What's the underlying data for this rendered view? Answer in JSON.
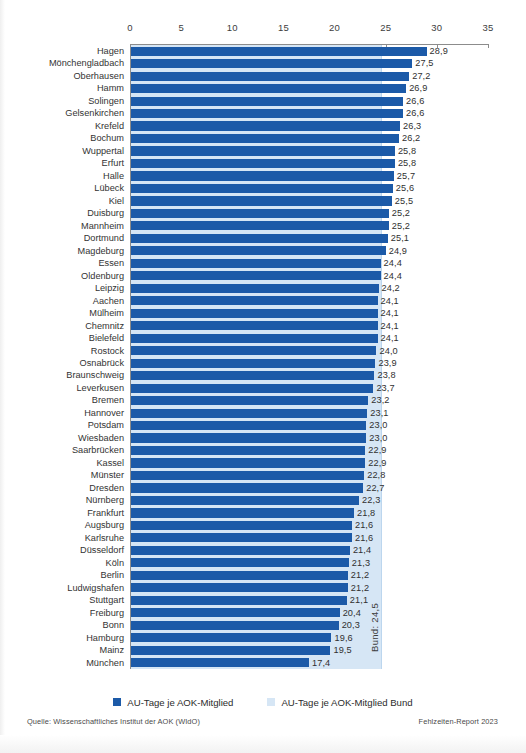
{
  "footer": {
    "source": "Quelle: Wissenschaftliches Institut der AOK (WIdO)",
    "report": "Fehlzeiten-Report 2023"
  },
  "legend": [
    {
      "label": "AU-Tage je AOK-Mitglied",
      "color": "#1c5aa8",
      "key": "primary"
    },
    {
      "label": "AU-Tage je AOK-Mitglied Bund",
      "color": "#d6e6f5",
      "key": "bund"
    }
  ],
  "reference": {
    "label": "Bund: 24,5",
    "value": 24.5
  },
  "chart_data": {
    "type": "bar",
    "orientation": "horizontal",
    "title": "",
    "xlabel": "",
    "ylabel": "",
    "xlim": [
      0,
      35
    ],
    "xticks": [
      0,
      5,
      10,
      15,
      20,
      25,
      30,
      35
    ],
    "xtick_labels": [
      "0",
      "5",
      "10",
      "15",
      "20",
      "25",
      "30",
      "35"
    ],
    "grid": false,
    "legend_position": "bottom-center",
    "decimal_separator": ",",
    "series": [
      {
        "name": "AU-Tage je AOK-Mitglied",
        "color": "#1c5aa8",
        "values": [
          28.9,
          27.5,
          27.2,
          26.9,
          26.6,
          26.6,
          26.3,
          26.2,
          25.8,
          25.8,
          25.7,
          25.6,
          25.5,
          25.2,
          25.2,
          25.1,
          24.9,
          24.4,
          24.4,
          24.2,
          24.1,
          24.1,
          24.1,
          24.1,
          24.0,
          23.9,
          23.8,
          23.7,
          23.2,
          23.1,
          23.0,
          23.0,
          22.9,
          22.9,
          22.8,
          22.7,
          22.3,
          21.8,
          21.6,
          21.6,
          21.4,
          21.3,
          21.2,
          21.2,
          21.1,
          20.4,
          20.3,
          19.6,
          19.5,
          17.4
        ]
      }
    ],
    "categories": [
      "Hagen",
      "Mönchengladbach",
      "Oberhausen",
      "Hamm",
      "Solingen",
      "Gelsenkirchen",
      "Krefeld",
      "Bochum",
      "Wuppertal",
      "Erfurt",
      "Halle",
      "Lübeck",
      "Kiel",
      "Duisburg",
      "Mannheim",
      "Dortmund",
      "Magdeburg",
      "Essen",
      "Oldenburg",
      "Leipzig",
      "Aachen",
      "Mülheim",
      "Chemnitz",
      "Bielefeld",
      "Rostock",
      "Osnabrück",
      "Braunschweig",
      "Leverkusen",
      "Bremen",
      "Hannover",
      "Potsdam",
      "Wiesbaden",
      "Saarbrücken",
      "Kassel",
      "Münster",
      "Dresden",
      "Nürnberg",
      "Frankfurt",
      "Augsburg",
      "Karlsruhe",
      "Düsseldorf",
      "Köln",
      "Berlin",
      "Ludwigshafen",
      "Stuttgart",
      "Freiburg",
      "Bonn",
      "Hamburg",
      "Mainz",
      "München"
    ],
    "value_labels": [
      "28,9",
      "27,5",
      "27,2",
      "26,9",
      "26,6",
      "26,6",
      "26,3",
      "26,2",
      "25,8",
      "25,8",
      "25,7",
      "25,6",
      "25,5",
      "25,2",
      "25,2",
      "25,1",
      "24,9",
      "24,4",
      "24,4",
      "24,2",
      "24,1",
      "24,1",
      "24,1",
      "24,1",
      "24,0",
      "23,9",
      "23,8",
      "23,7",
      "23,2",
      "23,1",
      "23,0",
      "23,0",
      "22,9",
      "22,9",
      "22,8",
      "22,7",
      "22,3",
      "21,8",
      "21,6",
      "21,6",
      "21,4",
      "21,3",
      "21,2",
      "21,2",
      "21,1",
      "20,4",
      "20,3",
      "19,6",
      "19,5",
      "17,4"
    ],
    "reference_line": {
      "name": "AU-Tage je AOK-Mitglied Bund",
      "value": 24.5,
      "label": "Bund: 24,5",
      "color": "#d6e6f5"
    }
  }
}
